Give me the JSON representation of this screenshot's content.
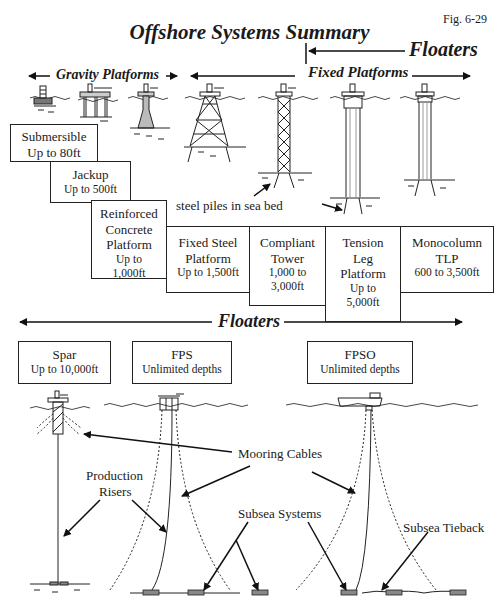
{
  "figure": {
    "title": "Offshore Systems Summary",
    "fig_number": "Fig. 6-29"
  },
  "sections": {
    "floaters_top": "Floaters",
    "gravity": "Gravity Platforms",
    "fixed": "Fixed Platforms",
    "floaters_bottom": "Floaters"
  },
  "platforms": [
    {
      "name": "Submersible",
      "depth": "Up to 80ft"
    },
    {
      "name": "Jackup",
      "depth": "Up to 500ft"
    },
    {
      "name": "Reinforced Concrete Platform",
      "name_lines": [
        "Reinforced",
        "Concrete",
        "Platform"
      ],
      "depth": "Up to 1,000ft",
      "depth_lines": [
        "Up to",
        "1,000ft"
      ]
    },
    {
      "name": "Fixed Steel Platform",
      "name_lines": [
        "Fixed Steel",
        "Platform"
      ],
      "depth": "Up to 1,500ft"
    },
    {
      "name": "Compliant Tower",
      "name_lines": [
        "Compliant",
        "Tower"
      ],
      "depth": "1,000 to 3,000ft",
      "depth_lines": [
        "1,000 to",
        "3,000ft"
      ]
    },
    {
      "name": "Tension Leg Platform",
      "name_lines": [
        "Tension",
        "Leg",
        "Platform"
      ],
      "depth": "Up to 5,000ft",
      "depth_lines": [
        "Up to",
        "5,000ft"
      ]
    },
    {
      "name": "Monocolumn TLP",
      "name_lines": [
        "Monocolumn",
        "TLP"
      ],
      "depth": "600 to 3,500ft"
    }
  ],
  "floaters": [
    {
      "name": "Spar",
      "depth": "Up to 10,000ft"
    },
    {
      "name": "FPS",
      "depth": "Unlimited depths"
    },
    {
      "name": "FPSO",
      "depth": "Unlimited depths"
    }
  ],
  "callouts": {
    "steel_piles": "steel piles in sea bed",
    "mooring": "Mooring Cables",
    "risers_line1": "Production",
    "risers_line2": "Risers",
    "subsea_systems": "Subsea Systems",
    "subsea_tieback": "Subsea Tieback"
  }
}
